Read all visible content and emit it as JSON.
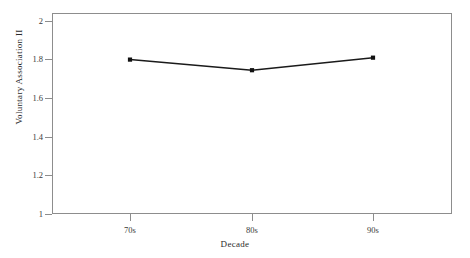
{
  "chart_data": {
    "type": "line",
    "title": "",
    "xlabel": "Decade",
    "ylabel": "Voluntary Association II",
    "categories": [
      "70s",
      "80s",
      "90s"
    ],
    "values": [
      1.8,
      1.745,
      1.81
    ],
    "series": [
      {
        "name": "Voluntary Association II",
        "values": [
          1.8,
          1.745,
          1.81
        ]
      }
    ],
    "ylim": [
      1,
      2
    ],
    "yticks": [
      1,
      1.2,
      1.4,
      1.6,
      1.8,
      2
    ],
    "ytick_labels": [
      "1",
      "1.2",
      "1.4",
      "1.6",
      "1.8",
      "2"
    ],
    "xtick_labels": [
      "70s",
      "80s",
      "90s"
    ],
    "grid": false,
    "legend": "none",
    "line_color": "#1a1a1a",
    "marker": "square",
    "marker_color": "#111111",
    "frame_color": "#8d8d8d",
    "background": "#ffffff"
  }
}
